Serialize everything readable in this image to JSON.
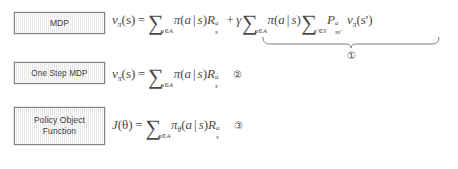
{
  "page": {
    "background": "#ffffff",
    "box_fill": "#f1f1f1",
    "box_border": "#828282",
    "math_color": "#4a4a4a",
    "label_color": "#3b3b3b"
  },
  "rows": [
    {
      "id": "mdp",
      "label": "MDP",
      "marker": "①",
      "marker_position": "underbrace",
      "formula_plain": "v_π(s) = ∑_{a∈A} π(a | s) R_s^a + γ ∑_{a∈A} π(a | s) ∑_{s'∈S} P_{ss'}^a v_π(s')",
      "parts": {
        "lhs_v": "v",
        "lhs_v_sub": "π",
        "lhs_arg": "(s)",
        "equals": "=",
        "sum1_symbol": "∑",
        "sum1_limits": "a∈A",
        "pi": "π",
        "pi_arg_open": "(",
        "pi_a": "a",
        "pi_bar": "|",
        "pi_s": "s",
        "pi_arg_close": ")",
        "R": "R",
        "R_sub": "s",
        "R_sup": "a",
        "plus": "+",
        "gamma": "γ",
        "sum2_symbol": "∑",
        "sum2_limits": "a∈A",
        "sum3_symbol": "∑",
        "sum3_limits": "s'∈S",
        "P": "P",
        "P_sub": "ss'",
        "P_sup": "a",
        "v2": "v",
        "v2_sub": "π",
        "v2_arg": "(s')"
      }
    },
    {
      "id": "one-step-mdp",
      "label": "One Step MDP",
      "marker": "②",
      "marker_position": "inline",
      "formula_plain": "v_π(s) = ∑_{a∈A} π(a | s) R_s^a",
      "parts": {
        "lhs_v": "v",
        "lhs_v_sub": "π",
        "lhs_arg": "(s)",
        "equals": "=",
        "sum1_symbol": "∑",
        "sum1_limits": "a∈A",
        "pi": "π",
        "pi_arg_open": "(",
        "pi_a": "a",
        "pi_bar": "|",
        "pi_s": "s",
        "pi_arg_close": ")",
        "R": "R",
        "R_sub": "s",
        "R_sup": "a"
      }
    },
    {
      "id": "policy-object-function",
      "label": "Policy Object\nFunction",
      "marker": "③",
      "marker_position": "inline",
      "formula_plain": "J(θ) = ∑_{a∈A} π_θ(a | s) R_s^a",
      "parts": {
        "lhs_J": "J",
        "lhs_arg": "(θ)",
        "equals": "=",
        "sum1_symbol": "∑",
        "sum1_limits": "a∈A",
        "pi": "π",
        "pi_sub": "θ",
        "pi_arg_open": "(",
        "pi_a": "a",
        "pi_bar": "|",
        "pi_s": "s",
        "pi_arg_close": ")",
        "R": "R",
        "R_sub": "s",
        "R_sup": "a"
      }
    }
  ]
}
